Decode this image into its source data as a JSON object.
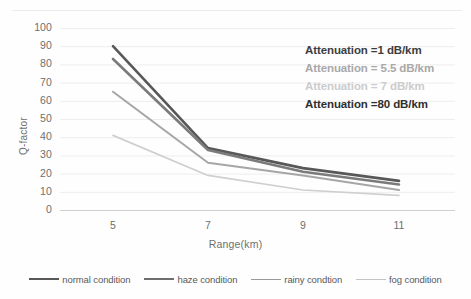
{
  "chart_data": {
    "type": "line",
    "title": "",
    "xlabel": "Range(km)",
    "ylabel": "Q-factor",
    "x": [
      5,
      7,
      9,
      11
    ],
    "xtick_labels": [
      "5",
      "7",
      "9",
      "11"
    ],
    "ytick_labels": [
      "100",
      "90",
      "80",
      "70",
      "60",
      "50",
      "40",
      "30",
      "20",
      "10",
      "0"
    ],
    "ylim": [
      0,
      100
    ],
    "ytick_step": 10,
    "grid": "horizontal",
    "legend_position": "bottom",
    "series": [
      {
        "name": "normal condition",
        "values": [
          90,
          34,
          23,
          16
        ],
        "color": "#585858"
      },
      {
        "name": "haze condition",
        "values": [
          83,
          33,
          21,
          14
        ],
        "color": "#7b7b7b"
      },
      {
        "name": "rainy condtion",
        "values": [
          65,
          26,
          19,
          11
        ],
        "color": "#a6a6a6"
      },
      {
        "name": "fog condition",
        "values": [
          41,
          19,
          11,
          8
        ],
        "color": "#cfcfcf"
      }
    ],
    "annotations": [
      {
        "text": "Attenuation =1 dB/km",
        "color": "#3d3d3d"
      },
      {
        "text": "Attenuation = 5.5 dB/km",
        "color": "#a8a8a8"
      },
      {
        "text": "Attenuation = 7 dB/km",
        "color": "#cccccc"
      },
      {
        "text": "Attenuation =80 dB/km",
        "color": "#2f2f2f"
      }
    ]
  },
  "legend": {
    "items": [
      {
        "label": "normal condition",
        "color": "#585858",
        "weight": 2.6
      },
      {
        "label": "haze condition",
        "color": "#6e6e6e",
        "weight": 2.6
      },
      {
        "label": "rainy condtion",
        "color": "#9a9a9a",
        "weight": 1.9
      },
      {
        "label": "fog condition",
        "color": "#c4c4c4",
        "weight": 1.5
      }
    ]
  }
}
